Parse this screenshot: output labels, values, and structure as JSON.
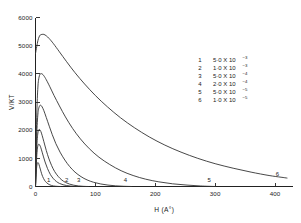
{
  "chart_data": {
    "type": "line",
    "title": "",
    "xlabel": "H (A°)",
    "ylabel": "V/KT",
    "xlim": [
      0,
      430
    ],
    "ylim": [
      0,
      6000
    ],
    "xticks": [
      0,
      100,
      200,
      300,
      400
    ],
    "xticklabels": [
      "0",
      "100",
      "200",
      "300",
      "400"
    ],
    "yticks": [
      0,
      1000,
      2000,
      3000,
      4000,
      5000,
      6000
    ],
    "yticklabels": [
      "0",
      "1000",
      "2000",
      "3000",
      "4000",
      "5000",
      "6000"
    ],
    "grid": false,
    "legend_position": "upper-right-inside",
    "series": [
      {
        "name": "1",
        "legend_number": "1",
        "legend_value": "5·0 X 10",
        "legend_exponent": "−3",
        "curve_label": "1",
        "label_x": 22,
        "label_y": 150,
        "peak_x": 4,
        "peak_y": 850,
        "tail_x": 30,
        "points": [
          [
            0,
            0
          ],
          [
            1,
            430
          ],
          [
            2,
            700
          ],
          [
            3,
            820
          ],
          [
            4,
            850
          ],
          [
            5,
            830
          ],
          [
            6,
            770
          ],
          [
            8,
            620
          ],
          [
            10,
            470
          ],
          [
            12,
            350
          ],
          [
            15,
            225
          ],
          [
            18,
            145
          ],
          [
            21,
            92
          ],
          [
            24,
            58
          ],
          [
            27,
            35
          ],
          [
            30,
            20
          ],
          [
            34,
            9
          ],
          [
            38,
            3
          ],
          [
            42,
            0
          ]
        ]
      },
      {
        "name": "2",
        "legend_number": "2",
        "legend_value": "1·0 X 10",
        "legend_exponent": "−3",
        "curve_label": "2",
        "label_x": 52,
        "label_y": 150,
        "peak_x": 6,
        "peak_y": 1500,
        "tail_x": 62,
        "points": [
          [
            0,
            0
          ],
          [
            1,
            600
          ],
          [
            2,
            1050
          ],
          [
            3,
            1320
          ],
          [
            4,
            1450
          ],
          [
            5,
            1495
          ],
          [
            6,
            1500
          ],
          [
            8,
            1430
          ],
          [
            10,
            1300
          ],
          [
            13,
            1080
          ],
          [
            16,
            870
          ],
          [
            20,
            640
          ],
          [
            25,
            420
          ],
          [
            30,
            275
          ],
          [
            35,
            175
          ],
          [
            40,
            110
          ],
          [
            46,
            62
          ],
          [
            52,
            34
          ],
          [
            58,
            16
          ],
          [
            64,
            6
          ],
          [
            70,
            0
          ]
        ]
      },
      {
        "name": "3",
        "legend_number": "3",
        "legend_value": "5·0 X 10",
        "legend_exponent": "−4",
        "curve_label": "3",
        "label_x": 72,
        "label_y": 150,
        "peak_x": 7,
        "peak_y": 2020,
        "tail_x": 80,
        "points": [
          [
            0,
            0
          ],
          [
            1,
            760
          ],
          [
            2,
            1340
          ],
          [
            3,
            1700
          ],
          [
            4,
            1900
          ],
          [
            5,
            2000
          ],
          [
            6,
            2020
          ],
          [
            7,
            2020
          ],
          [
            9,
            1950
          ],
          [
            11,
            1820
          ],
          [
            14,
            1590
          ],
          [
            18,
            1280
          ],
          [
            22,
            1010
          ],
          [
            27,
            740
          ],
          [
            32,
            530
          ],
          [
            38,
            355
          ],
          [
            44,
            230
          ],
          [
            50,
            145
          ],
          [
            57,
            85
          ],
          [
            64,
            45
          ],
          [
            72,
            20
          ],
          [
            80,
            6
          ],
          [
            88,
            0
          ]
        ]
      },
      {
        "name": "4",
        "legend_number": "4",
        "legend_value": "2·0 X 10",
        "legend_exponent": "−4",
        "curve_label": "4",
        "label_x": 150,
        "label_y": 150,
        "peak_x": 9,
        "peak_y": 2880,
        "tail_x": 160,
        "points": [
          [
            0,
            0
          ],
          [
            1,
            1000
          ],
          [
            2,
            1780
          ],
          [
            3,
            2270
          ],
          [
            4,
            2570
          ],
          [
            5,
            2740
          ],
          [
            7,
            2870
          ],
          [
            9,
            2880
          ],
          [
            11,
            2830
          ],
          [
            14,
            2690
          ],
          [
            18,
            2450
          ],
          [
            23,
            2140
          ],
          [
            28,
            1840
          ],
          [
            34,
            1520
          ],
          [
            41,
            1220
          ],
          [
            49,
            940
          ],
          [
            57,
            710
          ],
          [
            66,
            510
          ],
          [
            76,
            350
          ],
          [
            86,
            235
          ],
          [
            97,
            150
          ],
          [
            109,
            90
          ],
          [
            121,
            50
          ],
          [
            134,
            23
          ],
          [
            147,
            8
          ],
          [
            160,
            0
          ]
        ]
      },
      {
        "name": "5",
        "legend_number": "5",
        "legend_value": "5·0 X 10",
        "legend_exponent": "−5",
        "curve_label": "5",
        "label_x": 290,
        "label_y": 150,
        "peak_x": 11,
        "peak_y": 4000,
        "tail_x": 300,
        "points": [
          [
            0,
            0
          ],
          [
            1,
            1380
          ],
          [
            2,
            2440
          ],
          [
            3,
            3120
          ],
          [
            4,
            3530
          ],
          [
            5,
            3770
          ],
          [
            7,
            3970
          ],
          [
            9,
            4000
          ],
          [
            11,
            4000
          ],
          [
            14,
            3930
          ],
          [
            18,
            3790
          ],
          [
            24,
            3540
          ],
          [
            31,
            3230
          ],
          [
            40,
            2860
          ],
          [
            50,
            2470
          ],
          [
            62,
            2060
          ],
          [
            75,
            1690
          ],
          [
            90,
            1340
          ],
          [
            106,
            1040
          ],
          [
            124,
            780
          ],
          [
            143,
            560
          ],
          [
            163,
            390
          ],
          [
            184,
            260
          ],
          [
            206,
            165
          ],
          [
            229,
            95
          ],
          [
            253,
            50
          ],
          [
            276,
            18
          ],
          [
            300,
            0
          ]
        ]
      },
      {
        "name": "6",
        "legend_number": "6",
        "legend_value": "1·0 X 10",
        "legend_exponent": "−5",
        "curve_label": "6",
        "label_x": 404,
        "label_y": 360,
        "peak_x": 14,
        "peak_y": 5400,
        "tail_x": 420,
        "points": [
          [
            0,
            4720
          ],
          [
            2,
            4960
          ],
          [
            4,
            5180
          ],
          [
            6,
            5310
          ],
          [
            8,
            5380
          ],
          [
            11,
            5400
          ],
          [
            14,
            5400
          ],
          [
            18,
            5350
          ],
          [
            23,
            5250
          ],
          [
            30,
            5070
          ],
          [
            40,
            4780
          ],
          [
            52,
            4430
          ],
          [
            66,
            4040
          ],
          [
            82,
            3640
          ],
          [
            100,
            3230
          ],
          [
            120,
            2830
          ],
          [
            142,
            2440
          ],
          [
            165,
            2090
          ],
          [
            190,
            1760
          ],
          [
            216,
            1470
          ],
          [
            243,
            1220
          ],
          [
            271,
            1000
          ],
          [
            300,
            810
          ],
          [
            330,
            650
          ],
          [
            360,
            510
          ],
          [
            390,
            390
          ],
          [
            410,
            330
          ],
          [
            420,
            300
          ]
        ]
      }
    ]
  }
}
